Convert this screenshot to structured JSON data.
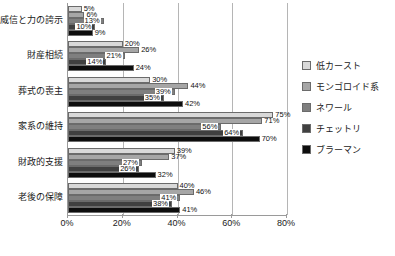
{
  "chart_data": {
    "type": "bar",
    "orientation": "horizontal",
    "title": "",
    "xlabel": "",
    "ylabel": "",
    "xlim": [
      0,
      80
    ],
    "xticks": [
      "0%",
      "20%",
      "40%",
      "60%",
      "80%"
    ],
    "xtick_values": [
      0,
      20,
      40,
      60,
      80
    ],
    "grid": true,
    "grid_axis": "x",
    "legend_position": "right",
    "categories": [
      "威信と力の誇示",
      "財産相続",
      "葬式の喪主",
      "家系の維持",
      "財政的支援",
      "老後の保障"
    ],
    "series": [
      {
        "name": "低カースト",
        "color": "#d9d9d9",
        "values": [
          5,
          20,
          30,
          75,
          39,
          40
        ],
        "labels": [
          "5%",
          "20%",
          "30%",
          "75%",
          "39%",
          "40%"
        ]
      },
      {
        "name": "モンゴロイド系",
        "color": "#a6a6a6",
        "values": [
          6,
          26,
          44,
          71,
          37,
          46
        ],
        "labels": [
          "6%",
          "26%",
          "44%",
          "71%",
          "37%",
          "46%"
        ]
      },
      {
        "name": "ネワール",
        "color": "#7f7f7f",
        "values": [
          13,
          21,
          39,
          56,
          27,
          41
        ],
        "labels": [
          "13%",
          "21%",
          "39%",
          "56%",
          "27%",
          "41%"
        ]
      },
      {
        "name": "チェットリ",
        "color": "#404040",
        "values": [
          10,
          14,
          35,
          64,
          26,
          38
        ],
        "labels": [
          "10%",
          "14%",
          "35%",
          "64%",
          "26%",
          "38%"
        ]
      },
      {
        "name": "ブラーマン",
        "color": "#0d0d0d",
        "values": [
          9,
          24,
          42,
          70,
          32,
          41
        ],
        "labels": [
          "9%",
          "24%",
          "42%",
          "70%",
          "32%",
          "41%"
        ]
      }
    ]
  },
  "caption": ""
}
